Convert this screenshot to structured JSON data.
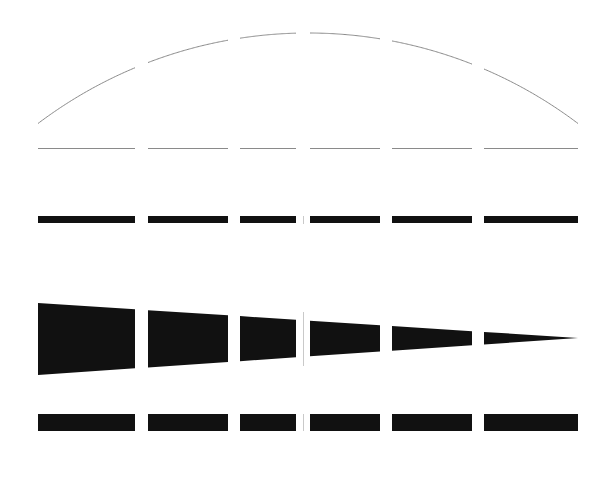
{
  "figure": {
    "title": "Segmented line-pair test pattern",
    "description": "Five stacked horizontal figure rows, each divided into six segments across a central vertical divider.",
    "width": 605,
    "height": 483,
    "background_color": "#ffffff",
    "ink_color": "#111111",
    "hairline_color": "#8a8a8a",
    "divider_color": "#c9c9c9"
  },
  "geometry": {
    "left_edge": 38,
    "right_edge": 578,
    "center_x": 303,
    "segment_gaps": [
      [
        135,
        148
      ],
      [
        228,
        240
      ],
      [
        296,
        310
      ],
      [
        380,
        392
      ],
      [
        472,
        484
      ]
    ],
    "segment_spans": [
      [
        38,
        135
      ],
      [
        148,
        228
      ],
      [
        240,
        296
      ],
      [
        310,
        380
      ],
      [
        392,
        472
      ],
      [
        484,
        578
      ]
    ]
  },
  "rows": [
    {
      "name": "arc-row",
      "label": "Arc",
      "shape": "arc",
      "segments": 6,
      "stroke_width": 1,
      "color": "#8a8a8a",
      "arc_apex_y": 33,
      "arc_end_y": 122,
      "arc_span_x": [
        40,
        576
      ]
    },
    {
      "name": "hairline-row",
      "label": "Hairline",
      "shape": "line",
      "segments": 6,
      "stroke_width": 1,
      "color": "#8a8a8a",
      "baseline_y": 148
    },
    {
      "name": "thick-bar-row",
      "label": "Thick bar",
      "shape": "bar",
      "segments": 6,
      "color": "#111111",
      "top_y": 216,
      "bar_height": 7
    },
    {
      "name": "wedge-row",
      "label": "Tapered wedge",
      "shape": "wedge",
      "segments": 6,
      "color": "#111111",
      "left_top_y": 303,
      "left_bottom_y": 375,
      "right_tip_y": 338,
      "taper": "linear"
    },
    {
      "name": "bottom-bar-row",
      "label": "Bottom bar",
      "shape": "bar",
      "segments": 6,
      "color": "#111111",
      "top_y": 414,
      "bar_height": 17
    }
  ],
  "center_ticks": [
    {
      "name": "tick-thick-bar",
      "x": 303,
      "y_top": 216,
      "y_bottom": 224,
      "color": "#c9c9c9"
    },
    {
      "name": "tick-wedge",
      "x": 303,
      "y_top": 312,
      "y_bottom": 366,
      "color": "#c9c9c9"
    },
    {
      "name": "tick-bottom-bar",
      "x": 303,
      "y_top": 414,
      "y_bottom": 431,
      "color": "#c9c9c9"
    }
  ],
  "chart_data": {
    "type": "line",
    "title": "Segmented line-pair test pattern",
    "xlabel": "",
    "ylabel": "",
    "grid": false,
    "legend_position": "none",
    "xlim": [
      38,
      578
    ],
    "ylim": [
      0,
      483
    ],
    "categories": [
      "seg-1",
      "seg-2",
      "seg-3",
      "seg-4",
      "seg-5",
      "seg-6"
    ],
    "series": [
      {
        "name": "arc",
        "kind": "arc-segments",
        "values": [
          122,
          60,
          36,
          36,
          60,
          122
        ],
        "note": "Segment end heights (y, px) of the shared circular arc"
      },
      {
        "name": "hairline",
        "kind": "line-segments",
        "values": [
          148,
          148,
          148,
          148,
          148,
          148
        ]
      },
      {
        "name": "thick-bar",
        "kind": "bar-segments",
        "values": [
          7,
          7,
          7,
          7,
          7,
          7
        ],
        "note": "Constant bar thickness in px across all six segments"
      },
      {
        "name": "wedge",
        "kind": "wedge-segments",
        "values": [
          72,
          60,
          49,
          40,
          28,
          15
        ],
        "note": "Wedge thickness in px at each segment's left edge; tapers to 0 at right"
      },
      {
        "name": "bottom-bar",
        "kind": "bar-segments",
        "values": [
          17,
          17,
          17,
          17,
          17,
          17
        ]
      }
    ],
    "segment_widths": [
      97,
      80,
      56,
      70,
      80,
      94
    ]
  }
}
